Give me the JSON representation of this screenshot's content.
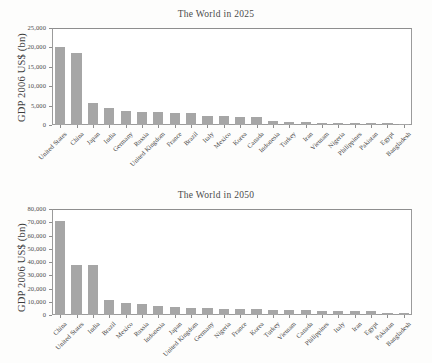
{
  "figure": {
    "background": "#fdfdfc",
    "bar_color": "#a6a6a6",
    "axis_color": "#8e8e8e"
  },
  "chart_data": [
    {
      "type": "bar",
      "title": "The World in 2025",
      "xlabel": "",
      "ylabel": "GDP 2006 US$ (bn)",
      "ylim": [
        0,
        25000
      ],
      "yticks": [
        0,
        5000,
        10000,
        15000,
        20000,
        25000
      ],
      "ytick_labels": [
        "0",
        "5,000",
        "10,000",
        "15,000",
        "20,000",
        "25,000"
      ],
      "grid": false,
      "legend": "none",
      "categories": [
        "United States",
        "China",
        "Japan",
        "India",
        "Germany",
        "Russia",
        "United Kingdom",
        "France",
        "Brazil",
        "Italy",
        "Mexico",
        "Korea",
        "Canada",
        "Indonesia",
        "Turkey",
        "Iran",
        "Vietnam",
        "Nigeria",
        "Philippines",
        "Pakistan",
        "Egypt",
        "Bangladesh"
      ],
      "values": [
        20000,
        18500,
        5700,
        4300,
        3600,
        3450,
        3250,
        3050,
        3000,
        2400,
        2350,
        2000,
        1950,
        1150,
        850,
        800,
        450,
        420,
        400,
        400,
        400,
        350
      ]
    },
    {
      "type": "bar",
      "title": "The World in 2050",
      "xlabel": "",
      "ylabel": "GDP 2006 US$ (bn)",
      "ylim": [
        0,
        80000
      ],
      "yticks": [
        0,
        10000,
        20000,
        30000,
        40000,
        50000,
        60000,
        70000,
        80000
      ],
      "ytick_labels": [
        "0",
        "10,000",
        "20,000",
        "30,000",
        "40,000",
        "50,000",
        "60,000",
        "70,000",
        "80,000"
      ],
      "grid": false,
      "legend": "none",
      "categories": [
        "China",
        "United States",
        "India",
        "Brazil",
        "Mexico",
        "Russia",
        "Indonesia",
        "Japan",
        "United Kingdom",
        "Germany",
        "Nigeria",
        "France",
        "Korea",
        "Turkey",
        "Vietnam",
        "Canada",
        "Philippines",
        "Italy",
        "Iran",
        "Egypt",
        "Pakistan",
        "Bangladesh"
      ],
      "values": [
        70700,
        38000,
        37700,
        11300,
        9300,
        8600,
        7000,
        6400,
        5500,
        5400,
        4700,
        4800,
        4300,
        3700,
        3600,
        3600,
        3100,
        3000,
        2900,
        2800,
        1800,
        1500
      ]
    }
  ]
}
